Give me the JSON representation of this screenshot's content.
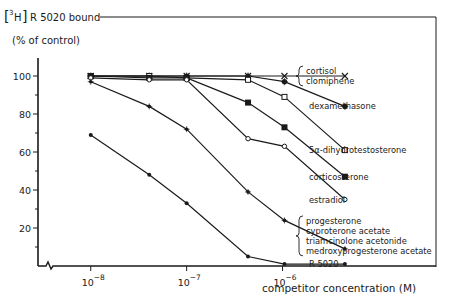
{
  "chart_data": {
    "type": "line",
    "title": "",
    "ylabel_line1_prefix": "3H",
    "ylabel_line1": "R 5020 bound",
    "ylabel_line2": "(% of control)",
    "xlabel": "competitor concentration (M)",
    "xscale": "log",
    "xlim_log10": [
      -8.55,
      -4.4
    ],
    "ylim": [
      0,
      110
    ],
    "yticks": [
      20,
      40,
      60,
      80,
      100
    ],
    "yticks_minor": [
      10,
      30,
      50,
      70,
      90
    ],
    "xticks": [
      {
        "exp": -8,
        "label_base": "10",
        "label_exp": "−8"
      },
      {
        "exp": -7,
        "label_base": "10",
        "label_exp": "−7"
      },
      {
        "exp": -6,
        "label_base": "10",
        "label_exp": "−6"
      }
    ],
    "axis_break": true,
    "x_log10": [
      -8.0,
      -7.39,
      -7.0,
      -6.36,
      -5.98,
      -5.35
    ],
    "series": [
      {
        "name": "cortisol / clomiphene",
        "labels": [
          "cortisol",
          "clomiphene"
        ],
        "marker": "x",
        "values": [
          100,
          100,
          100,
          100,
          100,
          100
        ]
      },
      {
        "name": "dexamethasone",
        "labels": [
          "dexamethasone"
        ],
        "marker": "asterisk",
        "values": [
          100,
          100,
          100,
          100,
          97,
          84
        ]
      },
      {
        "name": "5α-dihydrotestosterone",
        "labels": [
          "5α-dihydrotestosterone"
        ],
        "marker": "open-square",
        "values": [
          100,
          100,
          99,
          98,
          89,
          61
        ]
      },
      {
        "name": "corticosterone",
        "labels": [
          "corticosterone"
        ],
        "marker": "filled-square",
        "values": [
          100,
          99,
          99,
          86,
          73,
          47
        ]
      },
      {
        "name": "estradiol",
        "labels": [
          "estradiol"
        ],
        "marker": "open-circle",
        "values": [
          99,
          98,
          98,
          67,
          63,
          35
        ]
      },
      {
        "name": "progesterone group",
        "labels": [
          "progesterone",
          "cyproterone acetate",
          "triamcinolone acetonide",
          "medroxyprogesterone acetate"
        ],
        "marker": "star",
        "values": [
          97,
          84,
          72,
          39,
          24,
          9
        ]
      },
      {
        "name": "R 5020",
        "labels": [
          "R 5020"
        ],
        "marker": "dot",
        "values": [
          69,
          48,
          33,
          5,
          1,
          1
        ]
      }
    ],
    "legend": "right, inline labels at line ends",
    "grid": false
  }
}
